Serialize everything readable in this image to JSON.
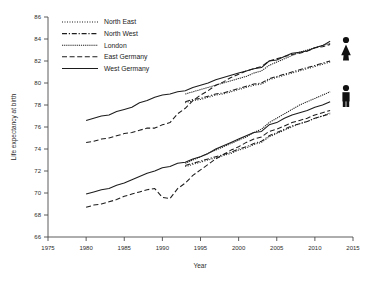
{
  "chart_data": {
    "type": "line",
    "title": "",
    "xlabel": "Year",
    "ylabel": "Life expectancy at birth",
    "xlim": [
      1975,
      2015
    ],
    "ylim": [
      66,
      86
    ],
    "xticks": [
      1975,
      1980,
      1985,
      1990,
      1995,
      2000,
      2005,
      2010,
      2015
    ],
    "yticks": [
      66,
      68,
      70,
      72,
      74,
      76,
      78,
      80,
      82,
      84,
      86
    ],
    "grid": false,
    "legend_position": "top-left",
    "annotations": [
      {
        "name": "female-glyph",
        "label": "female",
        "group": "upper cluster (females)"
      },
      {
        "name": "male-glyph",
        "label": "male",
        "group": "lower cluster (males)"
      }
    ],
    "legend": [
      {
        "name": "North East",
        "style": "dotted"
      },
      {
        "name": "North West",
        "style": "dash-dot"
      },
      {
        "name": "London",
        "style": "densely-dotted"
      },
      {
        "name": "East Germany",
        "style": "dashed"
      },
      {
        "name": "West Germany",
        "style": "solid"
      }
    ],
    "series": [
      {
        "name": "West Germany (female)",
        "sex": "female",
        "style": "solid",
        "x": [
          1980,
          1981,
          1982,
          1983,
          1984,
          1985,
          1986,
          1987,
          1988,
          1989,
          1990,
          1991,
          1992,
          1993,
          1994,
          1995,
          1996,
          1997,
          1998,
          1999,
          2000,
          2001,
          2002,
          2003,
          2004,
          2005,
          2006,
          2007,
          2008,
          2009,
          2010,
          2011,
          2012
        ],
        "values": [
          76.6,
          76.8,
          77.0,
          77.1,
          77.4,
          77.6,
          77.8,
          78.2,
          78.4,
          78.7,
          78.9,
          79.0,
          79.2,
          79.3,
          79.6,
          79.8,
          80.0,
          80.3,
          80.5,
          80.7,
          80.9,
          81.1,
          81.3,
          81.4,
          82.0,
          82.1,
          82.4,
          82.7,
          82.8,
          82.9,
          83.2,
          83.4,
          83.8
        ]
      },
      {
        "name": "East Germany (female)",
        "sex": "female",
        "style": "dashed",
        "x": [
          1980,
          1981,
          1982,
          1983,
          1984,
          1985,
          1986,
          1987,
          1988,
          1989,
          1990,
          1991,
          1992,
          1993,
          1994,
          1995,
          1996,
          1997,
          1998,
          1999,
          2000,
          2001,
          2002,
          2003,
          2004,
          2005,
          2006,
          2007,
          2008,
          2009,
          2010,
          2011,
          2012
        ],
        "values": [
          74.6,
          74.7,
          74.9,
          75.0,
          75.2,
          75.4,
          75.5,
          75.7,
          75.9,
          75.9,
          76.2,
          76.4,
          77.2,
          77.7,
          78.4,
          78.9,
          79.3,
          79.8,
          80.1,
          80.5,
          80.8,
          81.1,
          81.3,
          81.5,
          82.0,
          82.2,
          82.4,
          82.6,
          82.7,
          82.9,
          83.2,
          83.3,
          83.5
        ]
      },
      {
        "name": "North East (female)",
        "sex": "female",
        "style": "dotted",
        "x": [
          1993,
          1994,
          1995,
          1996,
          1997,
          1998,
          1999,
          2000,
          2001,
          2002,
          2003,
          2004,
          2005,
          2006,
          2007,
          2008,
          2009,
          2010,
          2011,
          2012
        ],
        "values": [
          78.2,
          78.4,
          78.5,
          78.7,
          78.9,
          79.0,
          79.2,
          79.4,
          79.6,
          79.8,
          79.9,
          80.3,
          80.5,
          80.7,
          80.9,
          81.1,
          81.3,
          81.5,
          81.7,
          81.9
        ]
      },
      {
        "name": "North West (female)",
        "sex": "female",
        "style": "dash-dot",
        "x": [
          1993,
          1994,
          1995,
          1996,
          1997,
          1998,
          1999,
          2000,
          2001,
          2002,
          2003,
          2004,
          2005,
          2006,
          2007,
          2008,
          2009,
          2010,
          2011,
          2012
        ],
        "values": [
          78.3,
          78.5,
          78.6,
          78.8,
          79.0,
          79.1,
          79.3,
          79.5,
          79.7,
          79.9,
          80.0,
          80.4,
          80.6,
          80.8,
          81.0,
          81.2,
          81.4,
          81.6,
          81.8,
          82.0
        ]
      },
      {
        "name": "London (female)",
        "sex": "female",
        "style": "densely-dotted",
        "x": [
          1993,
          1994,
          1995,
          1996,
          1997,
          1998,
          1999,
          2000,
          2001,
          2002,
          2003,
          2004,
          2005,
          2006,
          2007,
          2008,
          2009,
          2010,
          2011,
          2012
        ],
        "values": [
          79.0,
          79.2,
          79.4,
          79.6,
          79.8,
          80.0,
          80.2,
          80.4,
          80.6,
          80.9,
          81.1,
          81.6,
          81.9,
          82.2,
          82.5,
          82.8,
          83.0,
          83.2,
          83.4,
          83.6
        ]
      },
      {
        "name": "West Germany (male)",
        "sex": "male",
        "style": "solid",
        "x": [
          1980,
          1981,
          1982,
          1983,
          1984,
          1985,
          1986,
          1987,
          1988,
          1989,
          1990,
          1991,
          1992,
          1993,
          1994,
          1995,
          1996,
          1997,
          1998,
          1999,
          2000,
          2001,
          2002,
          2003,
          2004,
          2005,
          2006,
          2007,
          2008,
          2009,
          2010,
          2011,
          2012
        ],
        "values": [
          69.9,
          70.1,
          70.3,
          70.4,
          70.7,
          70.9,
          71.2,
          71.5,
          71.8,
          72.0,
          72.3,
          72.4,
          72.7,
          72.8,
          73.1,
          73.3,
          73.6,
          74.0,
          74.3,
          74.6,
          74.9,
          75.2,
          75.5,
          75.6,
          76.2,
          76.4,
          76.8,
          77.1,
          77.3,
          77.5,
          77.8,
          78.0,
          78.3
        ]
      },
      {
        "name": "East Germany (male)",
        "sex": "male",
        "style": "dashed",
        "x": [
          1980,
          1981,
          1982,
          1983,
          1984,
          1985,
          1986,
          1987,
          1988,
          1989,
          1990,
          1991,
          1992,
          1993,
          1994,
          1995,
          1996,
          1997,
          1998,
          1999,
          2000,
          2001,
          2002,
          2003,
          2004,
          2005,
          2006,
          2007,
          2008,
          2009,
          2010,
          2011,
          2012
        ],
        "values": [
          68.7,
          68.9,
          69.0,
          69.2,
          69.4,
          69.7,
          69.9,
          70.1,
          70.3,
          70.4,
          69.6,
          69.5,
          70.4,
          70.9,
          71.6,
          72.1,
          72.6,
          73.1,
          73.5,
          73.9,
          74.2,
          74.6,
          74.9,
          75.1,
          75.6,
          75.8,
          76.1,
          76.4,
          76.6,
          76.8,
          77.1,
          77.3,
          77.5
        ]
      },
      {
        "name": "North East (male)",
        "sex": "male",
        "style": "dotted",
        "x": [
          1993,
          1994,
          1995,
          1996,
          1997,
          1998,
          1999,
          2000,
          2001,
          2002,
          2003,
          2004,
          2005,
          2006,
          2007,
          2008,
          2009,
          2010,
          2011,
          2012
        ],
        "values": [
          72.4,
          72.6,
          72.8,
          73.0,
          73.2,
          73.4,
          73.6,
          73.9,
          74.1,
          74.4,
          74.6,
          75.1,
          75.4,
          75.7,
          76.0,
          76.3,
          76.5,
          76.8,
          77.0,
          77.3
        ]
      },
      {
        "name": "North West (male)",
        "sex": "male",
        "style": "dash-dot",
        "x": [
          1993,
          1994,
          1995,
          1996,
          1997,
          1998,
          1999,
          2000,
          2001,
          2002,
          2003,
          2004,
          2005,
          2006,
          2007,
          2008,
          2009,
          2010,
          2011,
          2012
        ],
        "values": [
          72.5,
          72.7,
          72.9,
          73.1,
          73.3,
          73.5,
          73.7,
          74.0,
          74.2,
          74.5,
          74.7,
          75.2,
          75.5,
          75.8,
          76.1,
          76.3,
          76.5,
          76.8,
          77.0,
          77.2
        ]
      },
      {
        "name": "London (male)",
        "sex": "male",
        "style": "densely-dotted",
        "x": [
          1993,
          1994,
          1995,
          1996,
          1997,
          1998,
          1999,
          2000,
          2001,
          2002,
          2003,
          2004,
          2005,
          2006,
          2007,
          2008,
          2009,
          2010,
          2011,
          2012
        ],
        "values": [
          72.7,
          73.0,
          73.3,
          73.6,
          73.9,
          74.2,
          74.5,
          74.8,
          75.1,
          75.5,
          75.8,
          76.4,
          76.8,
          77.2,
          77.6,
          78.0,
          78.3,
          78.6,
          78.9,
          79.2
        ]
      }
    ]
  }
}
